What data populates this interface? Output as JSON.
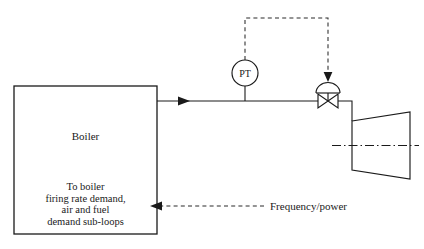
{
  "diagram": {
    "colors": {
      "line": "#1a1a1a",
      "dashed": "#2a2a2a",
      "background": "#ffffff"
    },
    "boiler": {
      "label": "Boiler",
      "sub_lines": [
        "To boiler",
        "firing rate demand,",
        "air and fuel",
        "demand sub-loops"
      ]
    },
    "instrument": {
      "tag": "PT",
      "name": "pressure-transmitter"
    },
    "valve": {
      "name": "control-valve",
      "actuator": "diaphragm-actuator"
    },
    "turbine": {
      "name": "steam-turbine"
    },
    "feedback": {
      "label": "Frequency/power"
    },
    "flow": {
      "arrow": "steam-flow-arrow"
    }
  }
}
